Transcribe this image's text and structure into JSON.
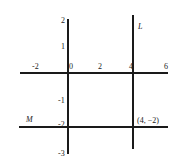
{
  "diagram": {
    "x_axis": {
      "tick_labels": [
        "-2",
        "0",
        "2",
        "4",
        "6"
      ]
    },
    "y_axis": {
      "tick_labels": [
        "2",
        "1",
        "-1",
        "-2",
        "-3"
      ]
    },
    "lines": [
      {
        "name": "L",
        "equation": "x = 4",
        "label": "L"
      },
      {
        "name": "M",
        "equation": "y = -2",
        "label": "M"
      }
    ],
    "intersection": {
      "label": "(4, −2)",
      "x": 4,
      "y": -2
    },
    "colors": {
      "line": "#1a1a1a",
      "text": "#222222",
      "background": "#ffffff"
    }
  }
}
